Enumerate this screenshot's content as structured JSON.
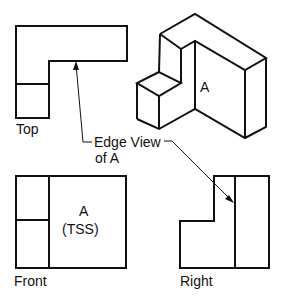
{
  "views": {
    "top": {
      "label": "Top"
    },
    "front": {
      "label": "Front",
      "face_label": "A",
      "face_sub": "(TSS)"
    },
    "right": {
      "label": "Right"
    },
    "isometric": {
      "face_label": "A"
    }
  },
  "callout": {
    "line1": "Edge View",
    "line2": "of A"
  },
  "colors": {
    "line": "#111111",
    "background": "#ffffff"
  }
}
